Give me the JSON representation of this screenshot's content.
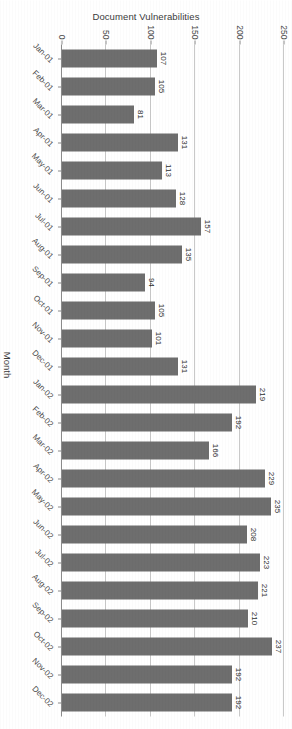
{
  "chart_data": {
    "type": "bar",
    "title": "",
    "xlabel": "Month",
    "ylabel": "Document Vulnerabilities",
    "ylim": [
      0,
      250
    ],
    "ytick_labels": [
      "0",
      "50",
      "100",
      "150",
      "200",
      "250"
    ],
    "ytick_values": [
      0,
      50,
      100,
      150,
      200,
      250
    ],
    "grid": true,
    "legend": "none",
    "orientation": "vertical-bars-rotated-90",
    "bar_color": "#6e6e6e",
    "categories": [
      "Jan-01",
      "Feb-01",
      "Mar-01",
      "Apr-01",
      "May-01",
      "Jun-01",
      "Jul-01",
      "Aug-01",
      "Sep-01",
      "Oct-01",
      "Nov-01",
      "Dec-01",
      "Jan-02",
      "Feb-02",
      "Mar-02",
      "Apr-02",
      "May-02",
      "Jun-02",
      "Jul-02",
      "Aug-02",
      "Sep-02",
      "Oct-02",
      "Nov-02",
      "Dec-02"
    ],
    "values": [
      107,
      105,
      81,
      131,
      113,
      128,
      157,
      135,
      94,
      105,
      101,
      131,
      219,
      192,
      166,
      229,
      235,
      208,
      223,
      221,
      210,
      237,
      192,
      192
    ],
    "data_labels": [
      "107",
      "105",
      "81",
      "131",
      "113",
      "128",
      "157",
      "135",
      "94",
      "105",
      "101",
      "131",
      "219",
      "192",
      "166",
      "229",
      "235",
      "208",
      "223",
      "221",
      "210",
      "237",
      "192",
      "192"
    ]
  }
}
